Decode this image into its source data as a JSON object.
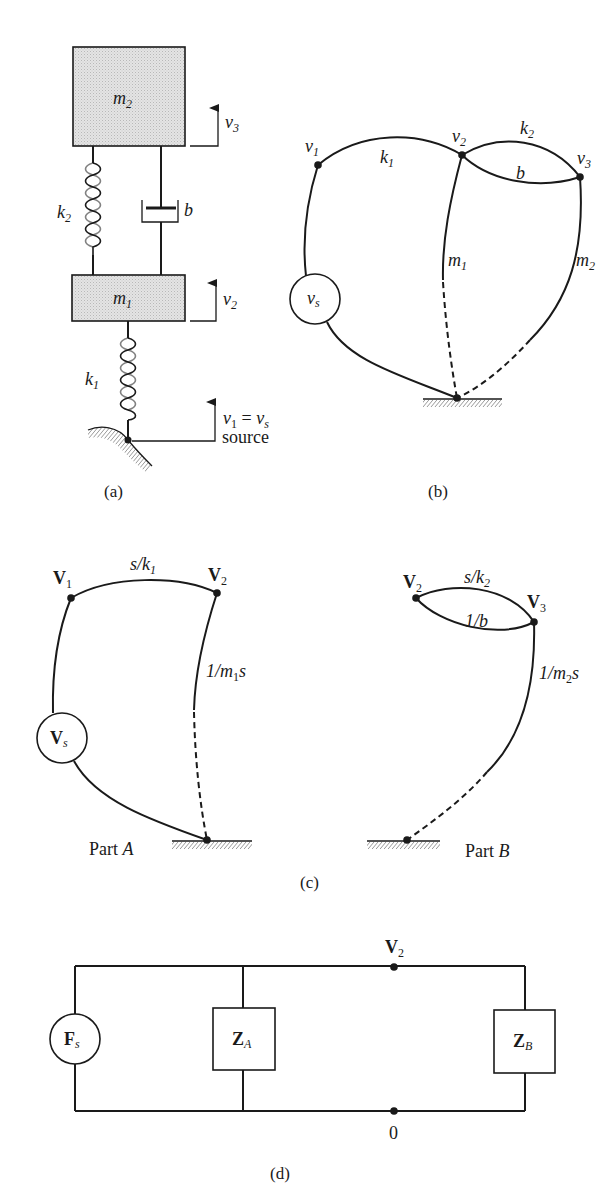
{
  "figure": {
    "panels": {
      "a": {
        "caption": "(a)",
        "masses": [
          {
            "name": "m",
            "sub": "2"
          },
          {
            "name": "m",
            "sub": "1"
          }
        ],
        "springs": [
          {
            "name": "k",
            "sub": "2"
          },
          {
            "name": "k",
            "sub": "1"
          }
        ],
        "damper": {
          "name": "b"
        },
        "velocities": [
          {
            "name": "v",
            "sub": "3"
          },
          {
            "name": "v",
            "sub": "2"
          },
          {
            "name": "v",
            "sub": "1",
            "eq": " = ",
            "rhs": "v",
            "rhs_sub": "s",
            "note": "source"
          }
        ]
      },
      "b": {
        "caption": "(b)",
        "nodes": [
          {
            "name": "v",
            "sub": "1"
          },
          {
            "name": "v",
            "sub": "2"
          },
          {
            "name": "v",
            "sub": "3"
          }
        ],
        "branches": {
          "k1": {
            "name": "k",
            "sub": "1"
          },
          "k2": {
            "name": "k",
            "sub": "2"
          },
          "b": {
            "name": "b"
          },
          "m1": {
            "name": "m",
            "sub": "1"
          },
          "m2": {
            "name": "m",
            "sub": "2"
          }
        },
        "source": {
          "name": "v",
          "sub": "s"
        }
      },
      "c": {
        "caption": "(c)",
        "part_a": {
          "label": "Part ",
          "label_it": "A",
          "nodes": [
            {
              "name": "V",
              "sub": "1"
            },
            {
              "name": "V",
              "sub": "2"
            }
          ],
          "branches": {
            "top": {
              "pre": "s/k",
              "sub": "1"
            },
            "right": {
              "pre": "1/m",
              "sub": "1",
              "post": "s"
            }
          },
          "source": {
            "name": "V",
            "sub": "s"
          }
        },
        "part_b": {
          "label": "Part ",
          "label_it": "B",
          "nodes": [
            {
              "name": "V",
              "sub": "2"
            },
            {
              "name": "V",
              "sub": "3"
            }
          ],
          "branches": {
            "top": {
              "pre": "s/k",
              "sub": "2"
            },
            "inner": {
              "pre": "1/b"
            },
            "right": {
              "pre": "1/m",
              "sub": "2",
              "post": "s"
            }
          }
        }
      },
      "d": {
        "caption": "(d)",
        "source": {
          "name": "F",
          "sub": "s"
        },
        "impedances": [
          {
            "name": "Z",
            "sub": "A"
          },
          {
            "name": "Z",
            "sub": "B"
          }
        ],
        "top_node": {
          "name": "V",
          "sub": "2"
        },
        "bottom_node": {
          "name": "0"
        }
      }
    }
  }
}
